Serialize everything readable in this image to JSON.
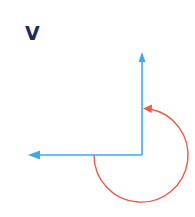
{
  "label": "V",
  "colors": {
    "label": "#1f2a5c",
    "vector": "#3fa9e6",
    "arc": "#f05a45",
    "background": "#ffffff"
  },
  "diagram": {
    "origin": [
      142,
      155
    ],
    "vector_up_tip": [
      142,
      52
    ],
    "vector_left_tip": [
      28,
      155
    ],
    "rotation_arc": {
      "center": [
        142,
        155
      ],
      "radius": 47,
      "start_deg": 180,
      "end_deg": 90,
      "direction": "counterclockwise-through-bottom"
    }
  }
}
